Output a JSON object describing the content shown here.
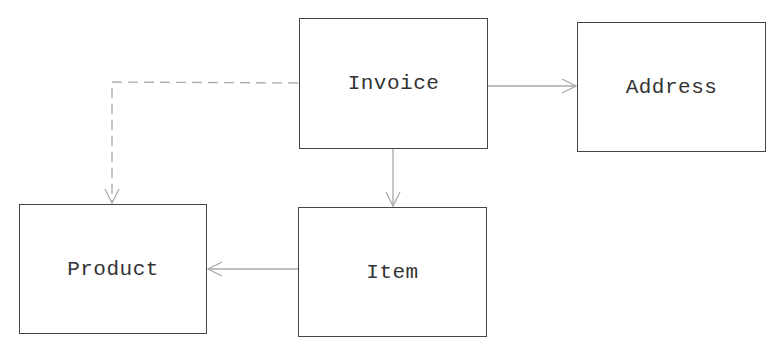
{
  "diagram": {
    "type": "class-relationship",
    "colors": {
      "box_border": "#444444",
      "edge": "#aaaaaa",
      "text": "#333333",
      "background": "#ffffff"
    },
    "nodes": [
      {
        "id": "invoice",
        "label": "Invoice",
        "x": 299,
        "y": 18,
        "w": 189,
        "h": 131
      },
      {
        "id": "address",
        "label": "Address",
        "x": 577,
        "y": 22,
        "w": 189,
        "h": 130
      },
      {
        "id": "product",
        "label": "Product",
        "x": 19,
        "y": 204,
        "w": 188,
        "h": 130
      },
      {
        "id": "item",
        "label": "Item",
        "x": 298,
        "y": 207,
        "w": 189,
        "h": 130
      }
    ],
    "edges": [
      {
        "from": "invoice",
        "to": "address",
        "style": "solid",
        "arrow": "open"
      },
      {
        "from": "invoice",
        "to": "item",
        "style": "solid",
        "arrow": "open"
      },
      {
        "from": "item",
        "to": "product",
        "style": "solid",
        "arrow": "open"
      },
      {
        "from": "invoice",
        "to": "product",
        "style": "dashed",
        "arrow": "open"
      }
    ]
  }
}
